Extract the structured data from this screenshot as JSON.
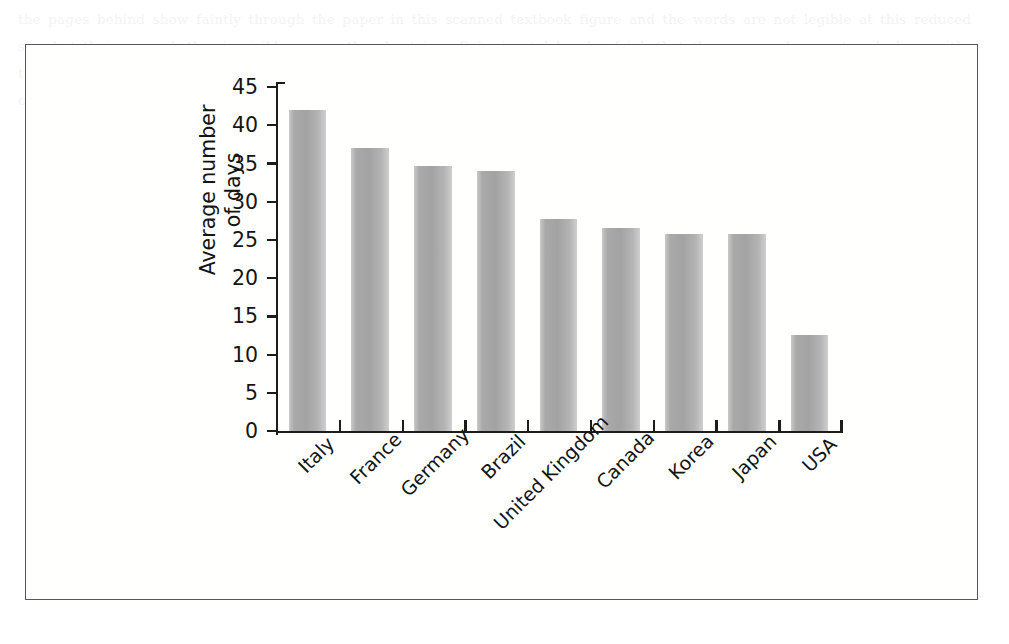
{
  "figure": {
    "frame_border_color": "#575757",
    "background_color": "#ffffff"
  },
  "chart_data": {
    "type": "bar",
    "title": "",
    "xlabel": "",
    "ylabel": "Average number of days",
    "ylabel_line1": "Average number",
    "ylabel_line2": "of days",
    "categories": [
      "Italy",
      "France",
      "Germany",
      "Brazil",
      "United Kingdom",
      "Canada",
      "Korea",
      "Japan",
      "USA"
    ],
    "values": [
      42,
      37,
      34.7,
      34,
      27.7,
      26.6,
      25.8,
      25.8,
      12.6
    ],
    "ylim": [
      0,
      45
    ],
    "yticks": [
      0,
      5,
      10,
      15,
      20,
      25,
      30,
      35,
      40,
      45
    ],
    "ytick_labels": [
      "0",
      "5",
      "10",
      "15",
      "20",
      "25",
      "30",
      "35",
      "40",
      "45"
    ],
    "grid": false,
    "legend": null,
    "bar_color": "#a8a8a8",
    "axis_color": "#1c1c1c",
    "label_rotation": -45
  },
  "bleed_text": "the pages behind show faintly through the paper in this scanned textbook figure and the words are not legible at this reduced size but their grey rhythm is visible across the sheet in soft horizontal bands of ink that the scanner has captured along with the chart itself and so the impression of type remains as a texture rather than as readable content for the reader who looks closely at the margins of the printed illustration while the figure in the foreground stays crisp and dark against the white"
}
